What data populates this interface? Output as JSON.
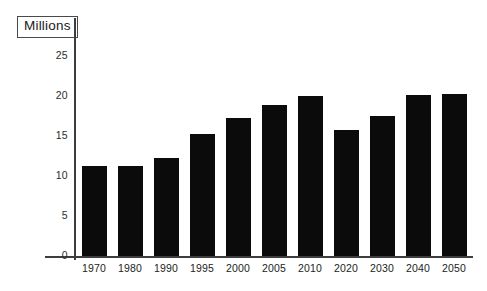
{
  "units_label": "Millions",
  "chart_data": {
    "type": "bar",
    "title": "",
    "subtitle": "",
    "xlabel": "",
    "ylabel": "Millions",
    "ylim": [
      0,
      25
    ],
    "yticks": [
      "0",
      "5",
      "10",
      "15",
      "20",
      "25"
    ],
    "grid": false,
    "legend": "none",
    "bar_color": "#0b0b0b",
    "axis_color": "#3d3d3d",
    "categories": [
      "1970",
      "1980",
      "1990",
      "1995",
      "2000",
      "2005",
      "2010",
      "2020",
      "2030",
      "2040",
      "2050"
    ],
    "values": [
      11.3,
      11.3,
      12.2,
      15.2,
      17.3,
      18.9,
      20.0,
      15.7,
      17.5,
      20.1,
      20.2
    ]
  }
}
